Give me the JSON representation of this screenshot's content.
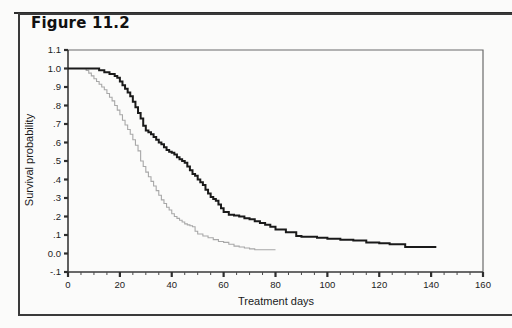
{
  "figure": {
    "label": "Figure 11.2"
  },
  "chart_data": {
    "type": "line",
    "title": "Figure 11.2",
    "subtitle": "",
    "xlabel": "Treatment days",
    "ylabel": "Survival probability",
    "xlim": [
      0,
      160
    ],
    "ylim": [
      -0.1,
      1.1
    ],
    "xticks": [
      0,
      20,
      40,
      60,
      80,
      100,
      120,
      140,
      160
    ],
    "xtick_labels": [
      "0",
      "20",
      "40",
      "60",
      "80",
      "100",
      "120",
      "140",
      "160"
    ],
    "x_minor_tick_step": 5,
    "yticks": [
      -0.1,
      0.0,
      0.1,
      0.2,
      0.3,
      0.4,
      0.5,
      0.6,
      0.7,
      0.8,
      0.9,
      1.0,
      1.1
    ],
    "ytick_labels": [
      "-.1",
      "0.0",
      ".1",
      ".2",
      ".3",
      ".4",
      ".5",
      ".6",
      ".7",
      ".8",
      ".9",
      "1.0",
      "1.1"
    ],
    "grid": false,
    "legend": "none",
    "step_type": "post",
    "series": [
      {
        "name": "group-1",
        "style": "step",
        "color": "#1a1a1a",
        "linewidth": 2.0,
        "x": [
          0,
          5,
          8,
          10,
          12,
          14,
          16,
          18,
          19,
          20,
          21,
          22,
          23,
          24,
          25,
          26,
          27,
          28,
          29,
          30,
          31,
          32,
          33,
          34,
          35,
          36,
          37,
          38,
          39,
          40,
          41,
          42,
          43,
          44,
          45,
          46,
          47,
          48,
          49,
          50,
          51,
          52,
          53,
          54,
          55,
          56,
          57,
          58,
          59,
          60,
          62,
          64,
          66,
          68,
          70,
          72,
          74,
          76,
          78,
          80,
          84,
          88,
          90,
          93,
          96,
          100,
          105,
          110,
          115,
          120,
          124,
          130,
          136,
          142
        ],
        "y": [
          1.0,
          1.0,
          1.0,
          1.0,
          0.99,
          0.98,
          0.97,
          0.96,
          0.95,
          0.93,
          0.91,
          0.89,
          0.87,
          0.85,
          0.82,
          0.79,
          0.76,
          0.73,
          0.69,
          0.665,
          0.655,
          0.645,
          0.63,
          0.615,
          0.6,
          0.59,
          0.575,
          0.56,
          0.55,
          0.545,
          0.535,
          0.52,
          0.51,
          0.5,
          0.49,
          0.47,
          0.45,
          0.43,
          0.42,
          0.4,
          0.385,
          0.37,
          0.345,
          0.325,
          0.305,
          0.295,
          0.285,
          0.265,
          0.245,
          0.225,
          0.21,
          0.205,
          0.2,
          0.19,
          0.185,
          0.175,
          0.165,
          0.155,
          0.145,
          0.13,
          0.115,
          0.095,
          0.09,
          0.09,
          0.085,
          0.08,
          0.075,
          0.07,
          0.06,
          0.055,
          0.05,
          0.035,
          0.035,
          0.035
        ]
      },
      {
        "name": "group-2",
        "style": "step",
        "color": "#a8a8a8",
        "linewidth": 1.1,
        "x": [
          0,
          3,
          5,
          7,
          8,
          9,
          10,
          11,
          12,
          13,
          14,
          15,
          16,
          17,
          18,
          19,
          20,
          21,
          22,
          23,
          24,
          25,
          26,
          27,
          28,
          29,
          30,
          31,
          32,
          33,
          34,
          35,
          36,
          37,
          38,
          39,
          40,
          41,
          42,
          43,
          44,
          45,
          46,
          47,
          48,
          49,
          50,
          52,
          54,
          56,
          58,
          60,
          62,
          64,
          66,
          68,
          70,
          72,
          74,
          76,
          78,
          80
        ],
        "y": [
          1.0,
          1.0,
          1.0,
          0.99,
          0.975,
          0.96,
          0.945,
          0.93,
          0.915,
          0.9,
          0.885,
          0.865,
          0.845,
          0.825,
          0.8,
          0.775,
          0.75,
          0.72,
          0.695,
          0.67,
          0.645,
          0.615,
          0.585,
          0.555,
          0.5,
          0.47,
          0.44,
          0.415,
          0.39,
          0.365,
          0.34,
          0.315,
          0.29,
          0.27,
          0.25,
          0.235,
          0.215,
          0.2,
          0.19,
          0.18,
          0.17,
          0.16,
          0.155,
          0.15,
          0.145,
          0.12,
          0.105,
          0.095,
          0.085,
          0.075,
          0.065,
          0.06,
          0.05,
          0.04,
          0.035,
          0.03,
          0.025,
          0.02,
          0.02,
          0.02,
          0.02,
          0.02
        ]
      }
    ]
  }
}
